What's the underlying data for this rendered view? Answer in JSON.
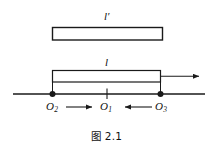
{
  "figure": {
    "caption": "图 2.1",
    "background_color": "#ffffff",
    "stroke_color": "#1a1a1a",
    "rods": [
      {
        "id": "upper-rod",
        "label": "l",
        "prime": "′",
        "label_full": "l′",
        "x": 52,
        "y": 27,
        "width": 111,
        "height": 13
      },
      {
        "id": "lower-rod",
        "label": "l",
        "prime": "",
        "label_full": "l",
        "x": 52,
        "y": 70,
        "width": 109,
        "height": 12
      }
    ],
    "axis": {
      "id": "horizontal-axis",
      "x1": 13,
      "x2": 205,
      "y": 94
    },
    "points": [
      {
        "id": "O2",
        "base": "O",
        "sub": "2",
        "x": 52,
        "marker": "dot"
      },
      {
        "id": "O1",
        "base": "O",
        "sub": "1",
        "x": 107,
        "marker": "tick"
      },
      {
        "id": "O3",
        "base": "O",
        "sub": "3",
        "x": 161,
        "marker": "dot"
      }
    ],
    "arrows": [
      {
        "id": "velocity-arrow-right",
        "from_x": 161,
        "to_x": 203,
        "y": 76,
        "direction": "right"
      },
      {
        "id": "arrow-O2-to-O1",
        "from_x": 66,
        "to_x": 96,
        "y": 107,
        "direction": "right"
      },
      {
        "id": "arrow-O3-to-O1",
        "from_x": 152,
        "to_x": 121,
        "y": 107,
        "direction": "left"
      }
    ]
  }
}
